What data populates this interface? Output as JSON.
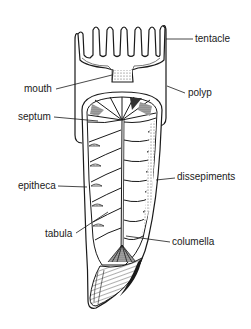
{
  "diagram": {
    "colors": {
      "ink": "#1a1a1a",
      "shade": "#6b6b6b",
      "background": "#ffffff"
    },
    "labels": [
      {
        "id": "tentacle",
        "text": "tentacle",
        "side": "right"
      },
      {
        "id": "mouth",
        "text": "mouth",
        "side": "left"
      },
      {
        "id": "polyp",
        "text": "polyp",
        "side": "right"
      },
      {
        "id": "septum",
        "text": "septum",
        "side": "left"
      },
      {
        "id": "dissepiments",
        "text": "dissepiments",
        "side": "right"
      },
      {
        "id": "epitheca",
        "text": "epitheca",
        "side": "left"
      },
      {
        "id": "tabula",
        "text": "tabula",
        "side": "left"
      },
      {
        "id": "columella",
        "text": "columella",
        "side": "right"
      }
    ]
  }
}
